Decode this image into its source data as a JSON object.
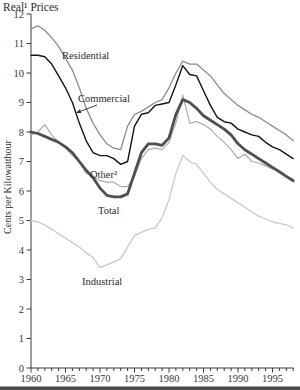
{
  "chart_data": {
    "type": "line",
    "title": "Real¹ Prices",
    "xlabel": "",
    "ylabel": "Cents per Kilowatthour",
    "x_range": [
      1960,
      1998
    ],
    "ylim": [
      0,
      12
    ],
    "y_ticks": [
      0,
      1,
      2,
      3,
      4,
      5,
      6,
      7,
      8,
      9,
      10,
      11,
      12
    ],
    "x_tick_labels": [
      1960,
      1965,
      1970,
      1975,
      1980,
      1985,
      1990,
      1995
    ],
    "grid": false,
    "legend": "inline-labels",
    "years": [
      1960,
      1961,
      1962,
      1963,
      1964,
      1965,
      1966,
      1967,
      1968,
      1969,
      1970,
      1971,
      1972,
      1973,
      1974,
      1975,
      1976,
      1977,
      1978,
      1979,
      1980,
      1981,
      1982,
      1983,
      1984,
      1985,
      1986,
      1987,
      1988,
      1989,
      1990,
      1991,
      1992,
      1993,
      1994,
      1995,
      1996,
      1997,
      1998
    ],
    "series": [
      {
        "name": "Industrial",
        "color": "#c9c9c9",
        "width": 1.3,
        "label": {
          "text": "Industrial",
          "x": 82,
          "y": 285
        },
        "values": [
          5.0,
          4.95,
          4.85,
          4.7,
          4.55,
          4.4,
          4.25,
          4.1,
          3.9,
          3.75,
          3.4,
          3.5,
          3.6,
          3.7,
          4.1,
          4.5,
          4.6,
          4.7,
          4.75,
          5.1,
          5.7,
          6.6,
          7.2,
          7.0,
          6.9,
          6.6,
          6.3,
          6.05,
          5.9,
          5.75,
          5.6,
          5.45,
          5.3,
          5.15,
          5.05,
          4.95,
          4.9,
          4.85,
          4.75
        ]
      },
      {
        "name": "Other",
        "color": "#adadad",
        "width": 1.2,
        "label": {
          "text": "Other²",
          "x": 90,
          "y": 178
        },
        "values": [
          7.9,
          8.0,
          8.25,
          7.9,
          7.65,
          7.45,
          7.2,
          7.0,
          6.6,
          6.5,
          6.35,
          6.3,
          6.3,
          6.15,
          6.15,
          6.5,
          7.1,
          7.4,
          7.45,
          7.4,
          7.65,
          8.3,
          9.25,
          8.3,
          8.35,
          8.25,
          8.1,
          7.85,
          7.65,
          7.4,
          7.1,
          7.25,
          7.0,
          6.95,
          6.85,
          6.75,
          6.65,
          6.5,
          6.4
        ]
      },
      {
        "name": "Residential",
        "color": "#8c8c8c",
        "width": 1.3,
        "label": {
          "text": "Residential",
          "x": 62,
          "y": 59
        },
        "values": [
          11.5,
          11.6,
          11.45,
          11.2,
          10.9,
          10.5,
          10.1,
          9.5,
          8.8,
          8.3,
          7.9,
          7.6,
          7.45,
          7.4,
          8.2,
          8.6,
          8.7,
          8.85,
          9.0,
          9.1,
          9.5,
          10.0,
          10.4,
          10.3,
          10.3,
          10.1,
          9.9,
          9.6,
          9.3,
          9.1,
          8.9,
          8.75,
          8.6,
          8.5,
          8.35,
          8.2,
          8.05,
          7.9,
          7.7
        ]
      },
      {
        "name": "Total",
        "color": "#4f4f4f",
        "width": 2.8,
        "label": {
          "text": "Total",
          "x": 98,
          "y": 214
        },
        "values": [
          8.0,
          7.95,
          7.85,
          7.75,
          7.65,
          7.5,
          7.3,
          7.0,
          6.7,
          6.45,
          6.1,
          5.85,
          5.8,
          5.8,
          5.9,
          6.6,
          7.3,
          7.6,
          7.6,
          7.55,
          7.8,
          8.6,
          9.1,
          9.0,
          8.8,
          8.55,
          8.4,
          8.25,
          8.1,
          7.9,
          7.6,
          7.4,
          7.25,
          7.1,
          6.95,
          6.8,
          6.65,
          6.5,
          6.35
        ]
      },
      {
        "name": "Commercial",
        "color": "#141414",
        "width": 1.4,
        "label": {
          "text": "Commercial",
          "x": 78,
          "y": 102
        },
        "arrow": {
          "x1": 97,
          "y1": 105,
          "x2": 76,
          "y2": 113
        },
        "values": [
          10.6,
          10.6,
          10.55,
          10.3,
          9.9,
          9.5,
          9.0,
          8.3,
          7.7,
          7.3,
          7.2,
          7.2,
          7.1,
          6.9,
          7.0,
          8.2,
          8.6,
          8.65,
          8.9,
          8.95,
          9.0,
          9.6,
          10.25,
          9.95,
          9.9,
          9.4,
          8.9,
          8.5,
          8.35,
          8.3,
          8.1,
          8.0,
          7.9,
          7.85,
          7.65,
          7.5,
          7.4,
          7.25,
          7.1
        ]
      }
    ]
  }
}
